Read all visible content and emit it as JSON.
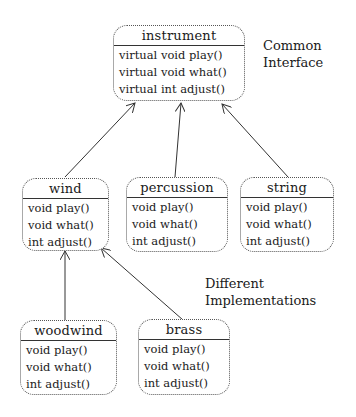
{
  "diagram": {
    "type": "class-hierarchy",
    "boxes": {
      "instrument": {
        "title": "instrument",
        "methods": [
          "virtual void play()",
          "virtual void what()",
          "virtual int adjust()"
        ]
      },
      "wind": {
        "title": "wind",
        "methods": [
          "void play()",
          "void what()",
          "int adjust()"
        ]
      },
      "percussion": {
        "title": "percussion",
        "methods": [
          "void play()",
          "void what()",
          "int adjust()"
        ]
      },
      "string": {
        "title": "string",
        "methods": [
          "void play()",
          "void what()",
          "int adjust()"
        ]
      },
      "woodwind": {
        "title": "woodwind",
        "methods": [
          "void play()",
          "void what()",
          "int adjust()"
        ]
      },
      "brass": {
        "title": "brass",
        "methods": [
          "void play()",
          "void what()",
          "int adjust()"
        ]
      }
    },
    "annotations": {
      "common_interface": [
        "Common",
        "Interface"
      ],
      "different_implementations": [
        "Different",
        "Implementations"
      ]
    },
    "edges": [
      {
        "from": "wind",
        "to": "instrument"
      },
      {
        "from": "percussion",
        "to": "instrument"
      },
      {
        "from": "string",
        "to": "instrument"
      },
      {
        "from": "woodwind",
        "to": "wind"
      },
      {
        "from": "brass",
        "to": "wind"
      }
    ],
    "colors": {
      "line": "#333333",
      "dotted_border": "#555555",
      "text": "#1a1a1a",
      "background": "#ffffff"
    }
  }
}
